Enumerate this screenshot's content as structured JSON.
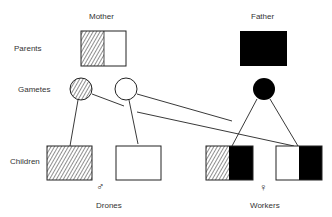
{
  "labels": {
    "mother": "Mother",
    "father": "Father",
    "row_parents": "Parents",
    "row_gametes": "Gametes",
    "row_children": "Children",
    "drones": "Drones",
    "workers": "Workers"
  },
  "symbols": {
    "male": "♂",
    "female": "♀"
  },
  "colors": {
    "stroke": "#222222",
    "fill_black": "#000000",
    "fill_white": "#ffffff",
    "hatch": "#333333"
  },
  "diagram": {
    "parents": [
      {
        "name": "Mother",
        "left": "hatched",
        "right": "white"
      },
      {
        "name": "Father",
        "fill": "black"
      }
    ],
    "gametes": [
      {
        "from": "Mother",
        "fill": "hatched"
      },
      {
        "from": "Mother",
        "fill": "white"
      },
      {
        "from": "Father",
        "fill": "black"
      }
    ],
    "children": [
      {
        "group": "Drones",
        "sex": "male",
        "composition": [
          "hatched"
        ]
      },
      {
        "group": "Drones",
        "sex": "male",
        "composition": [
          "white"
        ]
      },
      {
        "group": "Workers",
        "sex": "female",
        "composition": [
          "hatched",
          "black"
        ]
      },
      {
        "group": "Workers",
        "sex": "female",
        "composition": [
          "white",
          "black"
        ]
      }
    ]
  }
}
